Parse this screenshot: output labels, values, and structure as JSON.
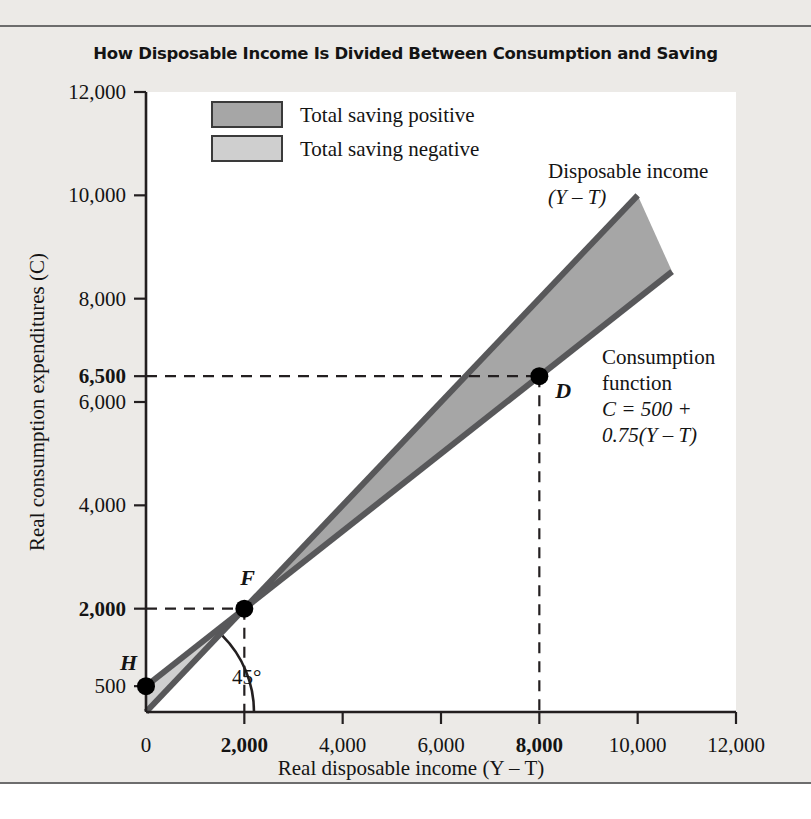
{
  "figure": {
    "title": "How Disposable Income Is Divided Between Consumption and Saving"
  },
  "legend": {
    "items": [
      {
        "label": "Total saving positive",
        "color": "#a6a6a6"
      },
      {
        "label": "Total saving negative",
        "color": "#cfcfcf"
      }
    ]
  },
  "annotations": {
    "disposable_income": {
      "line1": "Disposable income",
      "line2": "(Y – T)"
    },
    "consumption_function": {
      "line1": "Consumption",
      "line2": "function",
      "line3": "C = 500 +",
      "line4": "0.75(Y – T)"
    },
    "angle": "45°"
  },
  "points": [
    {
      "name": "H",
      "label": "H",
      "x": 0,
      "y": 500
    },
    {
      "name": "F",
      "label": "F",
      "x": 2000,
      "y": 2000
    },
    {
      "name": "D",
      "label": "D",
      "x": 8000,
      "y": 6500
    }
  ],
  "chart_data": {
    "type": "line",
    "title": "How Disposable Income Is Divided Between Consumption and Saving",
    "xlabel": "Real disposable income (Y – T)",
    "ylabel": "Real consumption expenditures (C)",
    "xlim": [
      0,
      12000
    ],
    "ylim": [
      0,
      12000
    ],
    "grid": false,
    "legend_position": "upper-left",
    "xticks": [
      0,
      2000,
      4000,
      6000,
      8000,
      10000,
      12000
    ],
    "xticklabels": [
      "0",
      "2,000",
      "4,000",
      "6,000",
      "8,000",
      "10,000",
      "12,000"
    ],
    "xticks_bold": [
      2000,
      8000
    ],
    "yticks": [
      500,
      2000,
      4000,
      6000,
      6500,
      8000,
      10000,
      12000
    ],
    "yticklabels": [
      "500",
      "2,000",
      "4,000",
      "6,000",
      "6,500",
      "8,000",
      "10,000",
      "12,000"
    ],
    "yticks_bold": [
      2000,
      6500
    ],
    "series": [
      {
        "name": "Disposable income (Y – T)",
        "equation": "C = Y – T",
        "x": [
          0,
          10000
        ],
        "values": [
          0,
          10000
        ]
      },
      {
        "name": "Consumption function",
        "equation": "C = 500 + 0.75(Y – T)",
        "intercept": 500,
        "slope": 0.75,
        "x": [
          0,
          10700
        ],
        "values": [
          500,
          8525
        ]
      }
    ],
    "shaded_regions": [
      {
        "name": "Total saving positive",
        "description": "Area between 45-degree line and consumption function for income above 2,000",
        "color": "#a6a6a6",
        "x_range": [
          2000,
          10700
        ]
      },
      {
        "name": "Total saving negative",
        "description": "Area between consumption function and 45-degree line for income below 2,000",
        "color": "#cfcfcf",
        "x_range": [
          0,
          2000
        ]
      }
    ],
    "annotations": [
      {
        "text": "45°",
        "x": 1400,
        "y": 700
      },
      {
        "text": "Disposable income (Y – T)",
        "x": 10200,
        "y": 10500
      },
      {
        "text": "Consumption function C = 500 + 0.75(Y – T)",
        "x": 10400,
        "y": 6600
      }
    ],
    "data_points": [
      {
        "label": "H",
        "x": 0,
        "y": 500
      },
      {
        "label": "F",
        "x": 2000,
        "y": 2000
      },
      {
        "label": "D",
        "x": 8000,
        "y": 6500
      }
    ]
  }
}
